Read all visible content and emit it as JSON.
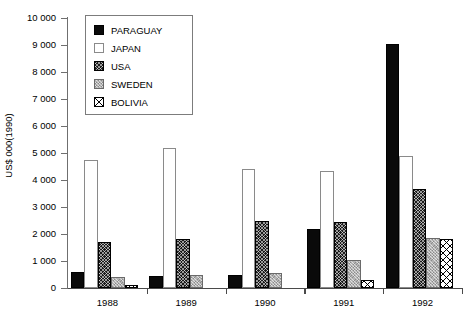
{
  "chart_data": {
    "type": "bar",
    "title": "",
    "subtitle": "",
    "xlabel": "",
    "ylabel": "US$ 000(1990)",
    "categories": [
      "1988",
      "1989",
      "1990",
      "1991",
      "1992"
    ],
    "ylim": [
      0,
      10000
    ],
    "ytick_step": 1000,
    "ytick_labels": [
      "0",
      "1 000",
      "2 000",
      "3 000",
      "4 000",
      "5 000",
      "6 000",
      "7 000",
      "8 000",
      "9 000",
      "10 000"
    ],
    "grid": false,
    "legend_position": "top-left-inside",
    "series": [
      {
        "name": "PARAGUAY",
        "pattern": "solid-black",
        "color": "#0a0a0a",
        "values": [
          600,
          430,
          470,
          2200,
          9050
        ]
      },
      {
        "name": "JAPAN",
        "pattern": "open-white",
        "color": "#ffffff",
        "values": [
          4750,
          5200,
          4400,
          4320,
          4900
        ]
      },
      {
        "name": "USA",
        "pattern": "dense-dark-crosshatch",
        "color": "#1a1a1a",
        "values": [
          1700,
          1800,
          2500,
          2450,
          3650
        ]
      },
      {
        "name": "SWEDEN",
        "pattern": "gray-stipple",
        "color": "#b3b3b3",
        "values": [
          400,
          500,
          550,
          1050,
          1850
        ]
      },
      {
        "name": "BOLIVIA",
        "pattern": "diagonal-crosshatch",
        "color": "#ffffff",
        "values": [
          100,
          0,
          0,
          280,
          1800
        ]
      }
    ]
  },
  "legend": {
    "items": [
      {
        "label": "PARAGUAY"
      },
      {
        "label": "JAPAN"
      },
      {
        "label": "USA"
      },
      {
        "label": "SWEDEN"
      },
      {
        "label": "BOLIVIA"
      }
    ]
  }
}
